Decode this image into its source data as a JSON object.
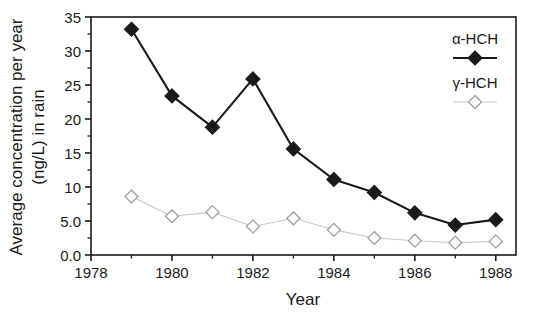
{
  "chart_data": {
    "type": "line",
    "title": "",
    "xlabel": "Year",
    "ylabel": "Average concentration per year (ng/L) in rain",
    "ylabel_line1": "Average concentration per year",
    "ylabel_line2": "(ng/L) in rain",
    "x": [
      1979,
      1980,
      1981,
      1982,
      1983,
      1984,
      1985,
      1986,
      1987,
      1988
    ],
    "xlim": [
      1978,
      1988.5
    ],
    "ylim": [
      0,
      35
    ],
    "xticks": [
      1978,
      1980,
      1982,
      1984,
      1986,
      1988
    ],
    "xtick_labels": [
      "1978",
      "1980",
      "1982",
      "1984",
      "1986",
      "1988"
    ],
    "xminor_ticks": [
      1979,
      1981,
      1983,
      1985,
      1987
    ],
    "yticks": [
      0,
      5,
      10,
      15,
      20,
      25,
      30,
      35
    ],
    "ytick_labels": [
      "0.0",
      "5.0",
      "10",
      "15",
      "20",
      "25",
      "30",
      "35"
    ],
    "grid": false,
    "legend_position": "top-right",
    "series": [
      {
        "name": "α-HCH",
        "marker": "filled-diamond",
        "color": "#1a1a1a",
        "line_color": "#1a1a1a",
        "values": [
          33.2,
          23.4,
          18.8,
          25.9,
          15.6,
          11.1,
          9.2,
          6.2,
          4.4,
          5.2
        ]
      },
      {
        "name": "γ-HCH",
        "marker": "open-diamond",
        "color": "#ffffff",
        "line_color": "#c8c8c8",
        "values": [
          8.6,
          5.7,
          6.3,
          4.2,
          5.4,
          3.7,
          2.5,
          2.1,
          1.8,
          2.0
        ]
      }
    ]
  },
  "legend": {
    "entries": [
      {
        "label": "α-HCH"
      },
      {
        "label": "γ-HCH"
      }
    ]
  },
  "axes": {
    "x_title": "Year",
    "y_title_line1": "Average concentration per year",
    "y_title_line2": "(ng/L) in rain"
  }
}
